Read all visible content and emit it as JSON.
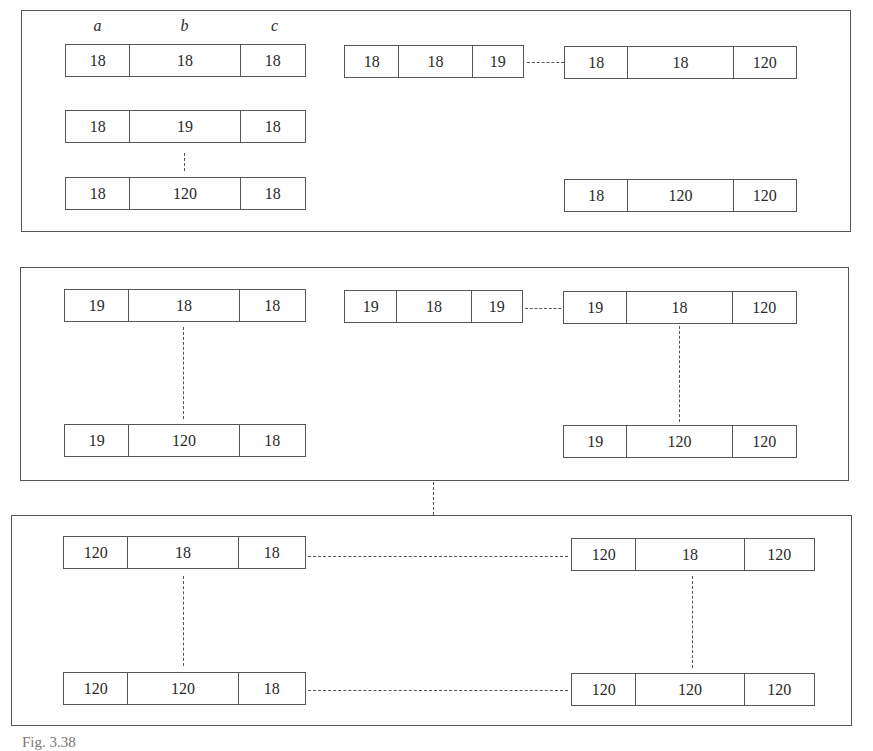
{
  "field_headers": [
    "a",
    "b",
    "c"
  ],
  "panels": [
    {
      "name": "a-eq-18",
      "keys": [
        {
          "id": "p1-k1",
          "values": [
            "18",
            "18",
            "18"
          ]
        },
        {
          "id": "p1-k2",
          "values": [
            "18",
            "19",
            "18"
          ]
        },
        {
          "id": "p1-k3",
          "values": [
            "18",
            "120",
            "18"
          ]
        },
        {
          "id": "p1-k4",
          "values": [
            "18",
            "18",
            "19"
          ]
        },
        {
          "id": "p1-k5",
          "values": [
            "18",
            "18",
            "120"
          ]
        },
        {
          "id": "p1-k6",
          "values": [
            "18",
            "120",
            "120"
          ]
        }
      ]
    },
    {
      "name": "a-eq-19",
      "keys": [
        {
          "id": "p2-k1",
          "values": [
            "19",
            "18",
            "18"
          ]
        },
        {
          "id": "p2-k2",
          "values": [
            "19",
            "120",
            "18"
          ]
        },
        {
          "id": "p2-k3",
          "values": [
            "19",
            "18",
            "19"
          ]
        },
        {
          "id": "p2-k4",
          "values": [
            "19",
            "18",
            "120"
          ]
        },
        {
          "id": "p2-k5",
          "values": [
            "19",
            "120",
            "120"
          ]
        }
      ]
    },
    {
      "name": "a-eq-120",
      "keys": [
        {
          "id": "p3-k1",
          "values": [
            "120",
            "18",
            "18"
          ]
        },
        {
          "id": "p3-k2",
          "values": [
            "120",
            "120",
            "18"
          ]
        },
        {
          "id": "p3-k3",
          "values": [
            "120",
            "18",
            "120"
          ]
        },
        {
          "id": "p3-k4",
          "values": [
            "120",
            "120",
            "120"
          ]
        }
      ]
    }
  ],
  "caption": "Fig. 3.38"
}
